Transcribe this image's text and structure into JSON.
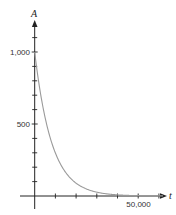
{
  "chart_data": {
    "type": "line",
    "title": "",
    "xlabel": "t",
    "ylabel": "A",
    "x_ticks": [
      0,
      10000,
      20000,
      30000,
      40000,
      50000,
      60000
    ],
    "x_tick_labels": [
      {
        "value": 50000,
        "label": "50,000"
      }
    ],
    "y_ticks": [
      0,
      100,
      200,
      300,
      400,
      500,
      600,
      700,
      800,
      900,
      1000,
      1100
    ],
    "y_tick_labels": [
      {
        "value": 500,
        "label": "500"
      },
      {
        "value": 1000,
        "label": "1,000"
      }
    ],
    "xlim": [
      0,
      63000
    ],
    "ylim": [
      0,
      1200
    ],
    "grid": false,
    "legend": null,
    "series": [
      {
        "name": "A(t)",
        "color": "#9a9a9a",
        "description": "exponential decay, A = 1000 * (1/2)^(t/5730)",
        "x": [
          0,
          2500,
          5000,
          5730,
          7500,
          10000,
          15000,
          20000,
          25000,
          30000,
          35000,
          40000,
          45000,
          50000
        ],
        "y": [
          1000,
          739,
          546,
          500,
          404,
          298,
          163,
          89,
          49,
          27,
          14,
          8,
          4,
          2
        ]
      }
    ]
  },
  "labels": {
    "y_axis": "A",
    "x_axis": "t",
    "y_1000": "1,000",
    "y_500": "500",
    "x_50000": "50,000"
  },
  "colors": {
    "axis": "#222222",
    "curve": "#9a9a9a"
  }
}
